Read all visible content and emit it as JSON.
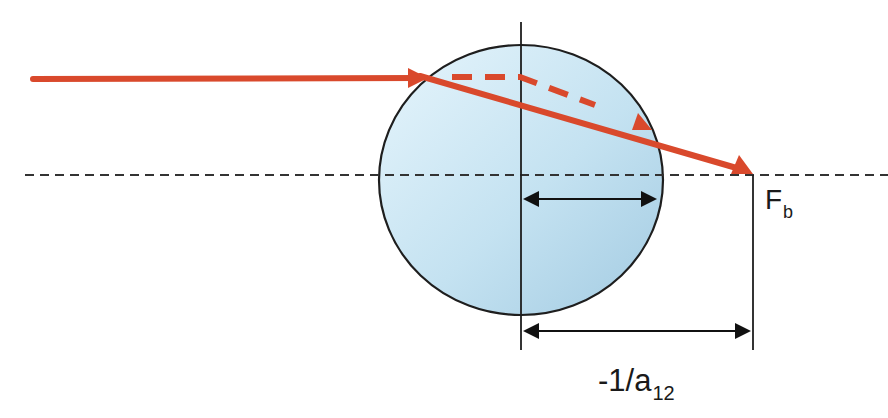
{
  "diagram": {
    "labels": {
      "focal_point": {
        "main": "F",
        "sub": "b"
      },
      "distance": {
        "main": "-1/a",
        "sub": "12"
      }
    },
    "colors": {
      "ray": "#d9492c",
      "outline": "#1e1e1e",
      "axis": "#333333",
      "lens_fill_light": "#e3f3fb",
      "lens_fill_dark": "#a8cfe5",
      "background": "#ffffff"
    },
    "geometry": {
      "optical_axis_y": 175,
      "lens": {
        "cx": 521,
        "cy": 180,
        "rx": 142,
        "ry": 135
      },
      "principal_plane_x": 521,
      "focal_point": {
        "x": 753,
        "y": 175
      },
      "incoming_ray": {
        "x1": 33,
        "y1": 79,
        "x2": 430,
        "y2": 78
      },
      "refracted_ray": {
        "x1": 430,
        "y1": 78,
        "x2": 753,
        "y2": 173
      },
      "virtual_ray_dashed": [
        [
          452,
          77
        ],
        [
          520,
          77
        ],
        [
          595,
          105
        ]
      ],
      "inner_dimension": {
        "x1": 523,
        "x2": 657,
        "y": 199
      },
      "outer_dimension": {
        "x1": 523,
        "x2": 751,
        "y": 331
      }
    }
  }
}
